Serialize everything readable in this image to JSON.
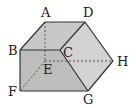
{
  "diagram": {
    "type": "solid-figure",
    "vertices": {
      "A": {
        "x": 45,
        "y": 22,
        "label": "A",
        "lx": 41,
        "ly": 17
      },
      "B": {
        "x": 20,
        "y": 50,
        "label": "B",
        "lx": 8,
        "ly": 55
      },
      "C": {
        "x": 60,
        "y": 50,
        "label": "C",
        "lx": 63,
        "ly": 57
      },
      "D": {
        "x": 85,
        "y": 22,
        "label": "D",
        "lx": 83,
        "ly": 17
      },
      "E": {
        "x": 45,
        "y": 61,
        "label": "E",
        "lx": 43,
        "ly": 74
      },
      "F": {
        "x": 20,
        "y": 91,
        "label": "F",
        "lx": 8,
        "ly": 96
      },
      "G": {
        "x": 88,
        "y": 91,
        "label": "G",
        "lx": 83,
        "ly": 104
      },
      "H": {
        "x": 113,
        "y": 61,
        "label": "H",
        "lx": 117,
        "ly": 66
      }
    },
    "solid_edges": [
      [
        "A",
        "D"
      ],
      [
        "A",
        "B"
      ],
      [
        "B",
        "C"
      ],
      [
        "C",
        "D"
      ],
      [
        "D",
        "H"
      ],
      [
        "H",
        "G"
      ],
      [
        "G",
        "F"
      ],
      [
        "F",
        "B"
      ],
      [
        "C",
        "G"
      ]
    ],
    "hidden_edges": [
      [
        "A",
        "E"
      ],
      [
        "E",
        "F"
      ],
      [
        "E",
        "H"
      ]
    ],
    "colors": {
      "edge": "#333333",
      "top_face": "#c8c8c8",
      "front_face": "#bdbdbd",
      "right_face": "#d2d2d2"
    }
  }
}
